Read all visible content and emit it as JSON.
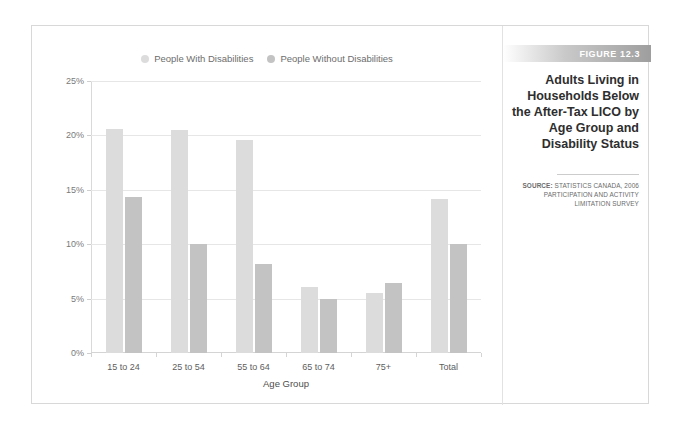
{
  "figure": {
    "banner_label": "FIGURE 12.3",
    "title": "Adults Living in Households Below the After-Tax LICO by Age Group and Disability Status",
    "source_label": "SOURCE:",
    "source_text": " STATISTICS CANADA, 2006 PARTICIPATION AND ACTIVITY LIMITATION SURVEY"
  },
  "colors": {
    "series_with_disabilities": "#dcdcdc",
    "series_without_disabilities": "#c3c3c3",
    "gridline": "#e6e6e6",
    "banner_end": "#9e9e9e",
    "frame_border": "#d8d8d8"
  },
  "chart_data": {
    "type": "bar",
    "title": "Adults Living in Households Below the After-Tax LICO by Age Group and Disability Status",
    "xlabel": "Age Group",
    "ylabel": "",
    "ylim": [
      0,
      25
    ],
    "yticks": [
      0,
      5,
      10,
      15,
      20,
      25
    ],
    "ytick_labels": [
      "0%",
      "5%",
      "10%",
      "15%",
      "20%",
      "25%"
    ],
    "grid": true,
    "legend_position": "top-center",
    "categories": [
      "15 to 24",
      "25 to 54",
      "55 to 64",
      "65 to 74",
      "75+",
      "Total"
    ],
    "series": [
      {
        "name": "People With Disabilities",
        "values": [
          20.6,
          20.5,
          19.6,
          6.1,
          5.5,
          14.2
        ]
      },
      {
        "name": "People Without Disabilities",
        "values": [
          14.3,
          10.0,
          8.2,
          5.0,
          6.4,
          10.0
        ]
      }
    ]
  }
}
